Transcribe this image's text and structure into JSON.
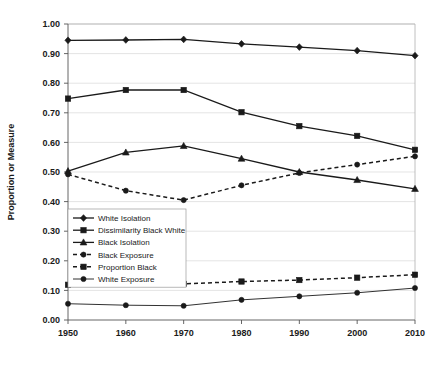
{
  "chart_data": {
    "type": "line",
    "title": "",
    "xlabel": "",
    "ylabel": "Proportion or Measure",
    "x": [
      1950,
      1960,
      1970,
      1980,
      1990,
      2000,
      2010
    ],
    "xtick_labels": [
      "1950",
      "1960",
      "1970",
      "1980",
      "1990",
      "2000",
      "2010"
    ],
    "ytick_labels": [
      "0.00",
      "0.10",
      "0.20",
      "0.30",
      "0.40",
      "0.50",
      "0.60",
      "0.70",
      "0.80",
      "0.90",
      "1.00"
    ],
    "ytick_values": [
      0.0,
      0.1,
      0.2,
      0.3,
      0.4,
      0.5,
      0.6,
      0.7,
      0.8,
      0.9,
      1.0
    ],
    "ylim": [
      0.0,
      1.0
    ],
    "xlim": [
      1950,
      2010
    ],
    "grid": true,
    "legend_position": "inside-lower-left",
    "series": [
      {
        "name": "White Isolation",
        "marker": "diamond",
        "style": "solid",
        "color": "#1a1a1a",
        "values": [
          0.945,
          0.946,
          0.948,
          0.933,
          0.922,
          0.91,
          0.893
        ]
      },
      {
        "name": "Dissimilarity Black White",
        "marker": "square",
        "style": "solid",
        "color": "#1a1a1a",
        "values": [
          0.748,
          0.777,
          0.777,
          0.702,
          0.655,
          0.622,
          0.575
        ]
      },
      {
        "name": "Black Isolation",
        "marker": "triangle",
        "style": "solid",
        "color": "#1a1a1a",
        "values": [
          0.503,
          0.566,
          0.588,
          0.545,
          0.5,
          0.473,
          0.443
        ]
      },
      {
        "name": "Black Exposure",
        "marker": "circle",
        "style": "dashed",
        "color": "#1a1a1a",
        "values": [
          0.492,
          0.437,
          0.405,
          0.455,
          0.497,
          0.525,
          0.553
        ]
      },
      {
        "name": "Proportion Black",
        "marker": "square",
        "style": "dashed",
        "color": "#1a1a1a",
        "values": [
          0.119,
          0.122,
          0.122,
          0.13,
          0.135,
          0.143,
          0.153
        ]
      },
      {
        "name": "White Exposure",
        "marker": "circle",
        "style": "solid-thin",
        "color": "#1a1a1a",
        "values": [
          0.055,
          0.05,
          0.048,
          0.068,
          0.08,
          0.092,
          0.108
        ]
      }
    ]
  }
}
